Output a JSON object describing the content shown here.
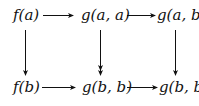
{
  "diagram": {
    "type": "commutative-diagram",
    "nodes": {
      "top_left": "f(a)",
      "top_middle": "g(a, a)",
      "top_right": "g(a, b)",
      "bottom_left": "f(b)",
      "bottom_middle": "g(b, b)",
      "bottom_right": "g(b, b)"
    },
    "edges": [
      {
        "from": "top_left",
        "to": "top_middle",
        "direction": "right"
      },
      {
        "from": "top_middle",
        "to": "top_right",
        "direction": "right"
      },
      {
        "from": "bottom_left",
        "to": "bottom_middle",
        "direction": "right"
      },
      {
        "from": "bottom_middle",
        "to": "bottom_right",
        "direction": "right"
      },
      {
        "from": "top_left",
        "to": "bottom_left",
        "direction": "down"
      },
      {
        "from": "top_middle",
        "to": "bottom_middle",
        "direction": "down",
        "style": "double-head"
      },
      {
        "from": "top_right",
        "to": "bottom_right",
        "direction": "down"
      }
    ],
    "colors": {
      "ink": "#111111",
      "background": "#ffffff"
    }
  }
}
